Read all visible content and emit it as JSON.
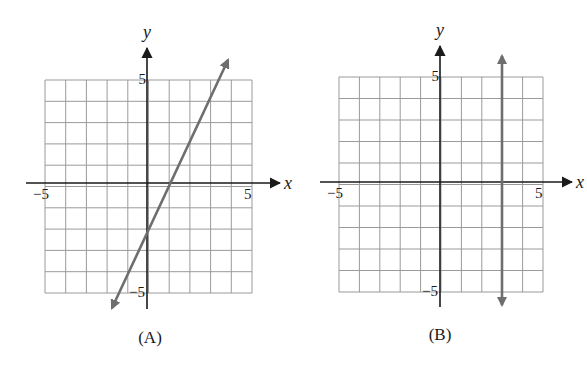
{
  "chart_data": [
    {
      "type": "line",
      "panel_label": "(A)",
      "title": "",
      "xlabel": "x",
      "ylabel": "y",
      "xlim": [
        -5,
        5
      ],
      "ylim": [
        -5,
        5
      ],
      "grid": true,
      "x_tick_labels": [
        "−5",
        "5"
      ],
      "y_tick_labels": [
        "5",
        "−5"
      ],
      "equation": "y = 2x - 2",
      "series": [
        {
          "name": "line",
          "x": [
            -1.75,
            4
          ],
          "y": [
            -5.5,
            6
          ],
          "arrows": "both"
        }
      ],
      "points_on_line": [
        {
          "x": 0,
          "y": -2
        },
        {
          "x": 1,
          "y": 0
        }
      ],
      "layout": {
        "grid_left": 45,
        "grid_right": 252,
        "grid_top": 80,
        "grid_bottom": 293,
        "origin_x": 147,
        "origin_y": 183,
        "xaxis_start": 26,
        "xaxis_end": 280,
        "yaxis_top": 48,
        "yaxis_bottom": 309,
        "line_start": [
          112,
          308
        ],
        "line_end": [
          228,
          60
        ],
        "panel_label_pos": [
          150,
          343
        ]
      }
    },
    {
      "type": "line",
      "panel_label": "(B)",
      "title": "",
      "xlabel": "x",
      "ylabel": "y",
      "xlim": [
        -5,
        5
      ],
      "ylim": [
        -5,
        5
      ],
      "grid": true,
      "x_tick_labels": [
        "−5",
        "5"
      ],
      "y_tick_labels": [
        "5",
        "−5"
      ],
      "equation": "x = 3",
      "series": [
        {
          "name": "line",
          "x": [
            3,
            3
          ],
          "y": [
            6,
            -6
          ],
          "arrows": "both"
        }
      ],
      "layout": {
        "grid_left": 339,
        "grid_right": 543,
        "grid_top": 77,
        "grid_bottom": 292,
        "origin_x": 440,
        "origin_y": 182,
        "xaxis_start": 320,
        "xaxis_end": 572,
        "yaxis_top": 46,
        "yaxis_bottom": 307,
        "line_start": [
          502,
          305
        ],
        "line_end": [
          502,
          56
        ],
        "panel_label_pos": [
          440,
          340
        ]
      }
    }
  ],
  "colors": {
    "grid": "#9a9a9a",
    "axis": "#1a1a1a",
    "plot_line": "#6e6e6e",
    "background": "#ffffff"
  }
}
